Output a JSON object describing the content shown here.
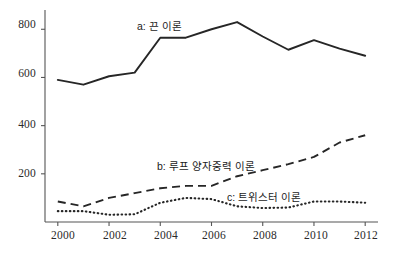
{
  "chart_data": {
    "type": "line",
    "title": "",
    "subtitle": "",
    "xlabel": "",
    "ylabel": "",
    "x": [
      2000,
      2001,
      2002,
      2003,
      2004,
      2005,
      2006,
      2007,
      2008,
      2009,
      2010,
      2011,
      2012
    ],
    "xlim": [
      1999.5,
      2012.5
    ],
    "ylim": [
      0,
      880
    ],
    "grid": false,
    "legend_position": "inline-annotations",
    "xticks": [
      "2000",
      "2002",
      "2004",
      "2006",
      "2008",
      "2010",
      "2012"
    ],
    "xtick_values": [
      2000,
      2002,
      2004,
      2006,
      2008,
      2010,
      2012
    ],
    "yticks": [
      "200",
      "400",
      "600",
      "800"
    ],
    "ytick_values": [
      200,
      400,
      600,
      800
    ],
    "series": [
      {
        "name": "a: 끈 이론",
        "key": "a",
        "style": "solid",
        "color": "#262626",
        "label": "a: 끈 이론",
        "values": [
          590,
          570,
          605,
          620,
          765,
          765,
          800,
          830,
          770,
          715,
          755,
          720,
          690
        ]
      },
      {
        "name": "b: 루프 양자중력 이론",
        "key": "b",
        "style": "dashed",
        "color": "#262626",
        "label": "b: 루프 양자중력 이론",
        "values": [
          85,
          65,
          100,
          120,
          140,
          150,
          150,
          190,
          215,
          240,
          270,
          330,
          360
        ]
      },
      {
        "name": "c: 트위스터 이론",
        "key": "c",
        "style": "dotted",
        "color": "#262626",
        "label": "c: 트위스터 이론",
        "values": [
          45,
          45,
          30,
          32,
          80,
          100,
          95,
          65,
          58,
          60,
          85,
          85,
          80
        ]
      }
    ],
    "annotations": [
      {
        "text": "a: 끈 이론",
        "series": "a",
        "x_px": 137,
        "y_px": 18
      },
      {
        "text": "b: 루프 양자중력 이론",
        "series": "b",
        "x_px": 157,
        "y_px": 158
      },
      {
        "text": "c: 트위스터 이론",
        "series": "c",
        "x_px": 227,
        "y_px": 189
      }
    ],
    "axes": {
      "x_axis_color": "#555555",
      "y_axis_color": "#555555",
      "plot_left_px": 45,
      "plot_right_px": 378,
      "plot_top_px": 10,
      "plot_bottom_px": 222
    }
  },
  "ytick_labels": [
    {
      "text": "800",
      "top_px": 18
    },
    {
      "text": "600",
      "top_px": 67
    },
    {
      "text": "400",
      "top_px": 118
    },
    {
      "text": "200",
      "top_px": 167
    }
  ],
  "xtick_labels": [
    {
      "text": "2000",
      "left_px": 43
    },
    {
      "text": "2002",
      "left_px": 95
    },
    {
      "text": "2004",
      "left_px": 146
    },
    {
      "text": "2006",
      "left_px": 194
    },
    {
      "text": "2008",
      "left_px": 245
    },
    {
      "text": "2010",
      "left_px": 296
    },
    {
      "text": "2012",
      "left_px": 346
    }
  ]
}
